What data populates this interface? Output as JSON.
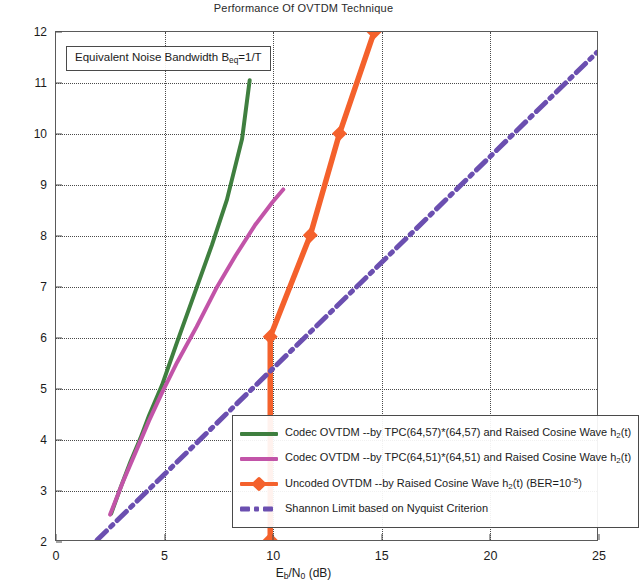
{
  "chart_data": {
    "type": "line",
    "title": "Performance Of OVTDM Technique",
    "xlabel": "Eb/N0 (dB)",
    "ylabel": "Spectrum Efficiency (bit/s/Hz)",
    "xlim": [
      0,
      25
    ],
    "ylim": [
      2,
      12
    ],
    "xticks": [
      "0",
      "5",
      "10",
      "15",
      "20",
      "25"
    ],
    "xtick_values": [
      0,
      5,
      10,
      15,
      20,
      25
    ],
    "yticks": [
      "2",
      "3",
      "4",
      "5",
      "6",
      "7",
      "8",
      "9",
      "10",
      "11",
      "12"
    ],
    "ytick_values": [
      2,
      3,
      4,
      5,
      6,
      7,
      8,
      9,
      10,
      11,
      12
    ],
    "grid": "dotted both axes",
    "legend_position": "lower right inside axes",
    "annotation": "Equivalent Noise Bandwidth Beq=1/T",
    "series": [
      {
        "name": "Codec OVTDM --by TPC(64,57)*(64,57) and Raised Cosine Wave h2(t)",
        "color": "#3f7f3f",
        "style": "solid",
        "marker": "none",
        "x": [
          2.55,
          3.0,
          3.45,
          3.9,
          4.3,
          4.9,
          5.6,
          6.4,
          7.2,
          7.9,
          8.6,
          8.95
        ],
        "y": [
          2.52,
          3.05,
          3.55,
          4.0,
          4.45,
          5.05,
          5.9,
          6.85,
          7.8,
          8.7,
          9.9,
          11.05
        ]
      },
      {
        "name": "Codec OVTDM --by TPC(64,51)*(64,51) and Raised Cosine Wave h2(t)",
        "color": "#c254a8",
        "style": "solid",
        "marker": "none",
        "x": [
          2.5,
          3.1,
          3.7,
          4.3,
          4.9,
          5.6,
          6.5,
          7.4,
          8.3,
          9.2,
          10.0,
          10.5
        ],
        "y": [
          2.5,
          3.15,
          3.75,
          4.35,
          4.9,
          5.5,
          6.2,
          6.95,
          7.6,
          8.2,
          8.65,
          8.9
        ]
      },
      {
        "name": "Uncoded OVTDM --by Raised Cosine Wave h2(t) (BER=10^-5)",
        "color": "#f4612c",
        "style": "solid",
        "marker": "diamond",
        "x": [
          9.9,
          9.9,
          11.75,
          13.1,
          14.7
        ],
        "y": [
          2.0,
          6.0,
          8.0,
          10.0,
          12.0
        ]
      },
      {
        "name": "Shannon Limit based on Nyquist Criterion",
        "color": "#6b4fb0",
        "style": "dash-dot",
        "marker": "none",
        "x": [
          1.9,
          25.0
        ],
        "y": [
          2.0,
          11.6
        ]
      }
    ]
  },
  "title": {
    "text": "Performance Of OVTDM Technique"
  },
  "annotation": {
    "prefix": "Equivalent Noise Bandwidth B",
    "sub": "eq",
    "suffix": "=1/T"
  },
  "axes": {
    "x_label_main": "E",
    "x_label_sub1": "b",
    "x_label_mid": "/N",
    "x_label_sub2": "0",
    "x_label_unit": " (dB)",
    "y_label": "Spectrum Efficiency (bit/s/Hz)"
  },
  "legend": {
    "items": [
      {
        "text_a": "Codec OVTDM --by TPC(64,57)*(64,57) and Raised Cosine Wave h",
        "sub": "2",
        "text_b": "(t)",
        "color": "#3f7f3f",
        "marker": "line"
      },
      {
        "text_a": "Codec OVTDM --by TPC(64,51)*(64,51) and Raised Cosine Wave h",
        "sub": "2",
        "text_b": "(t)",
        "color": "#c254a8",
        "marker": "line"
      },
      {
        "text_a": "Uncoded OVTDM --by Raised Cosine Wave h",
        "sub": "2",
        "text_b": "(t) (BER=10",
        "sup": "-5",
        "text_c": ")",
        "color": "#f4612c",
        "marker": "line-diamond"
      },
      {
        "text_a": "Shannon Limit based on Nyquist Criterion",
        "color": "#6b4fb0",
        "marker": "dash-dot"
      }
    ]
  },
  "colors": {
    "green": "#3f7f3f",
    "magenta": "#c254a8",
    "orange": "#f4612c",
    "purple": "#6b4fb0",
    "axis": "#4a4a4a"
  }
}
